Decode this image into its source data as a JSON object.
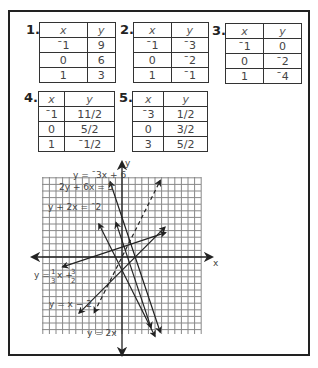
{
  "problems": [
    {
      "number": "1.",
      "headers": [
        "x",
        "y"
      ],
      "rows": [
        [
          "ˉ1",
          "9"
        ],
        [
          "0",
          "6"
        ],
        [
          "1",
          "3"
        ]
      ]
    },
    {
      "number": "2.",
      "headers": [
        "x",
        "y"
      ],
      "rows": [
        [
          "ˉ1",
          "ˉ3"
        ],
        [
          "0",
          "ˉ2"
        ],
        [
          "1",
          "ˉ1"
        ]
      ]
    },
    {
      "number": "3.",
      "headers": [
        "x",
        "y"
      ],
      "rows": [
        [
          "ˉ1",
          "0"
        ],
        [
          "0",
          "ˉ2"
        ],
        [
          "1",
          "ˉ4"
        ]
      ]
    },
    {
      "number": "4.",
      "headers": [
        "x",
        "y"
      ],
      "rows": [
        [
          "ˉ1",
          "11/2"
        ],
        [
          "0",
          "5/2"
        ],
        [
          "1",
          "ˉ1/2"
        ]
      ]
    },
    {
      "number": "5.",
      "headers": [
        "x",
        "y"
      ],
      "rows": [
        [
          "ˉ3",
          "1/2"
        ],
        [
          "0",
          "3/2"
        ],
        [
          "3",
          "5/2"
        ]
      ]
    }
  ],
  "graph": {
    "x_axis_label": "x",
    "y_axis_label": "y",
    "line_labels": {
      "l1": "y = ˉ3x + 6",
      "l2": "2y + 6x = 5",
      "l3": "y + 2x = ˉ2",
      "l4_a": "y =",
      "l4_b": "x +",
      "l4_n1": "1",
      "l4_d1": "3",
      "l4_n2": "3",
      "l4_d2": "2",
      "l5": "y = x − 2",
      "l6": "y = 2x"
    }
  },
  "chart_data": {
    "type": "line",
    "title": "",
    "xlabel": "x",
    "ylabel": "y",
    "xlim": [
      -12,
      12
    ],
    "ylim": [
      -12,
      12
    ],
    "grid": true,
    "series": [
      {
        "name": "y = -3x + 6",
        "slope": -3,
        "intercept": 6,
        "style": "solid"
      },
      {
        "name": "2y + 6x = 5",
        "slope": -3,
        "intercept": 2.5,
        "style": "solid"
      },
      {
        "name": "y + 2x = -2",
        "slope": -2,
        "intercept": -2,
        "style": "solid"
      },
      {
        "name": "y = 1/3 x + 3/2",
        "slope": 0.3333,
        "intercept": 1.5,
        "style": "solid"
      },
      {
        "name": "y = x - 2",
        "slope": 1,
        "intercept": -2,
        "style": "solid"
      },
      {
        "name": "y = 2x",
        "slope": 2,
        "intercept": 0,
        "style": "dashed"
      }
    ]
  }
}
